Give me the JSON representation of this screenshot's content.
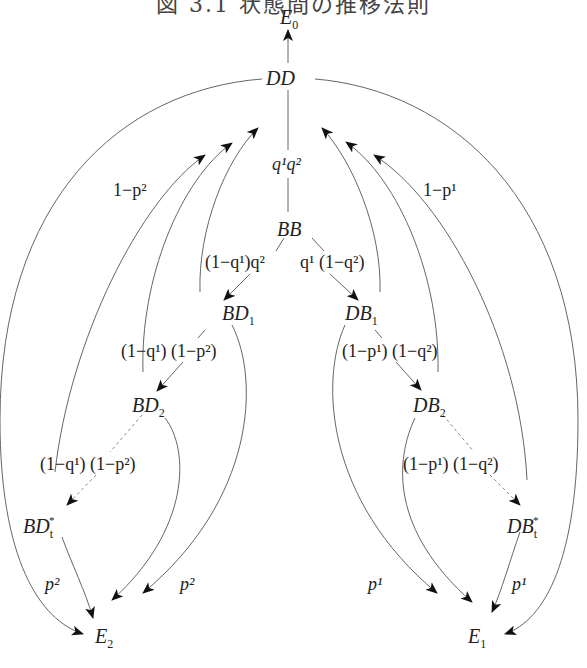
{
  "figure": {
    "title": "図 3.1 状態間の推移法則"
  },
  "nodes": {
    "E0": {
      "base": "E",
      "sub": "0"
    },
    "DD": {
      "base": "DD"
    },
    "BB": {
      "base": "BB"
    },
    "BD1": {
      "base": "BD",
      "sub": "1"
    },
    "DB1": {
      "base": "DB",
      "sub": "1"
    },
    "BD2": {
      "base": "BD",
      "sub": "2"
    },
    "DB2": {
      "base": "DB",
      "sub": "2"
    },
    "BDt": {
      "base": "BD",
      "sub": "t",
      "sup": "*"
    },
    "DBt": {
      "base": "DB",
      "sub": "t",
      "sup": "*"
    },
    "E2": {
      "base": "E",
      "sub": "2"
    },
    "E1": {
      "base": "E",
      "sub": "1"
    }
  },
  "labels": {
    "dd_bb": "q¹q²",
    "bb_bd1": "(1−q¹)q²",
    "bb_db1": "q¹ (1−q²)",
    "bd1_bd2": "(1−q¹) (1−p²)",
    "db1_db2": "(1−p¹) (1−q²)",
    "bd2_bdt": "(1−q¹) (1−p²)",
    "db2_dbt": "(1−p¹) (1−q²)",
    "left_return": "1−p²",
    "right_return": "1−p¹",
    "left_to_e2_outer": "p²",
    "left_to_e2_inner": "p²",
    "right_to_e1_outer": "p¹",
    "right_to_e1_inner": "p¹"
  },
  "edges": [
    {
      "from": "DD",
      "to": "E0",
      "style": "solid"
    },
    {
      "from": "DD",
      "to": "BB",
      "label": "q¹q²",
      "style": "solid"
    },
    {
      "from": "BB",
      "to": "BD1",
      "label": "(1−q¹)q²",
      "style": "solid"
    },
    {
      "from": "BB",
      "to": "DB1",
      "label": "q¹ (1−q²)",
      "style": "solid"
    },
    {
      "from": "BD1",
      "to": "BD2",
      "label": "(1−q¹) (1−p²)",
      "style": "solid"
    },
    {
      "from": "DB1",
      "to": "DB2",
      "label": "(1−p¹) (1−q²)",
      "style": "solid"
    },
    {
      "from": "BD2",
      "to": "BDt",
      "label": "(1−q¹) (1−p²)",
      "style": "dashed"
    },
    {
      "from": "DB2",
      "to": "DBt",
      "label": "(1−p¹) (1−q²)",
      "style": "dashed"
    },
    {
      "from": "BD1",
      "to": "DD",
      "label": "1−p²",
      "style": "solid"
    },
    {
      "from": "BD2",
      "to": "DD",
      "label": "1−p²",
      "style": "solid"
    },
    {
      "from": "BDt",
      "to": "DD",
      "label": "1−p²",
      "style": "solid"
    },
    {
      "from": "DB1",
      "to": "DD",
      "label": "1−p¹",
      "style": "solid"
    },
    {
      "from": "DB2",
      "to": "DD",
      "label": "1−p¹",
      "style": "solid"
    },
    {
      "from": "DBt",
      "to": "DD",
      "label": "1−p¹",
      "style": "solid"
    },
    {
      "from": "DD",
      "to": "E2",
      "style": "solid"
    },
    {
      "from": "DD",
      "to": "E1",
      "style": "solid"
    },
    {
      "from": "BD1",
      "to": "E2",
      "label": "p²",
      "style": "solid"
    },
    {
      "from": "BD2",
      "to": "E2",
      "label": "p²",
      "style": "solid"
    },
    {
      "from": "BDt",
      "to": "E2",
      "label": "p²",
      "style": "solid"
    },
    {
      "from": "DB1",
      "to": "E1",
      "label": "p¹",
      "style": "solid"
    },
    {
      "from": "DB2",
      "to": "E1",
      "label": "p¹",
      "style": "solid"
    },
    {
      "from": "DBt",
      "to": "E1",
      "label": "p¹",
      "style": "solid"
    }
  ]
}
